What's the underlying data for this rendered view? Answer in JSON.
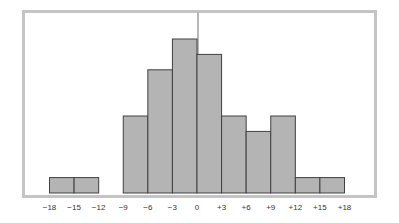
{
  "chart_data": {
    "type": "bar",
    "subtype": "histogram",
    "title": "",
    "xlabel": "",
    "ylabel": "",
    "bin_edges": [
      -18,
      -15,
      -12,
      -9,
      -6,
      -3,
      0,
      3,
      6,
      9,
      12,
      15,
      18
    ],
    "categories": [
      "-18 to -15",
      "-15 to -12",
      "-12 to -9",
      "-9 to -6",
      "-6 to -3",
      "-3 to 0",
      "0 to +3",
      "+3 to +6",
      "+6 to +9",
      "+9 to +12",
      "+12 to +15",
      "+15 to +18"
    ],
    "values": [
      1,
      1,
      0,
      5,
      8,
      10,
      9,
      5,
      4,
      5,
      1,
      1
    ],
    "tick_labels": [
      "−18",
      "−15",
      "−12",
      "−9",
      "−6",
      "−3",
      "0",
      "+3",
      "+6",
      "+9",
      "+12",
      "+15",
      "+18"
    ],
    "xlim": [
      -18,
      18
    ],
    "ylim": [
      0,
      11.8
    ],
    "grid": false,
    "legend": "none",
    "reference_line": {
      "x": 0,
      "orientation": "vertical"
    },
    "colors": {
      "bar_fill": "#b4b4b4",
      "bar_edge": "#404040",
      "frame": "#c4c4c4",
      "reference_line": "#b8b8b8"
    }
  }
}
